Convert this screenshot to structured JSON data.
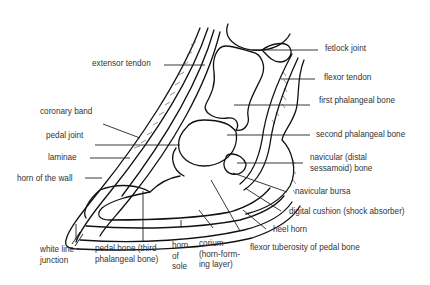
{
  "diagram": {
    "labels": {
      "fetlock_joint": "fetlock joint",
      "extensor_tendon": "extensor tendon",
      "flexor_tendon": "flexor tendon",
      "first_phalangeal_bone": "first phalangeal bone",
      "coronary_band": "coronary band",
      "pedal_joint": "pedal joint",
      "second_phalangeal_bone": "second phalangeal bone",
      "laminae": "laminae",
      "horn_of_the_wall": "horn of the wall",
      "navicular_bone_line1": "navicular (distal",
      "navicular_bone_line2": "sessamoid) bone",
      "navicular_bursa": "navicular bursa",
      "digital_cushion": "digital cushion (shock absorber)",
      "heel_horn": "heel horn",
      "flexor_tuberosity": "flexor tuberosity of pedal bone",
      "white_line_line1": "white line",
      "white_line_line2": "junction",
      "pedal_bone_line1": "pedal bone (third",
      "pedal_bone_line2": "phalangeal bone)",
      "horn_of_sole_line1": "horn",
      "horn_of_sole_line2": "of",
      "horn_of_sole_line3": "sole",
      "corium_line1": "corium",
      "corium_line2": "(horn-form-",
      "corium_line3": "ing layer)"
    }
  }
}
